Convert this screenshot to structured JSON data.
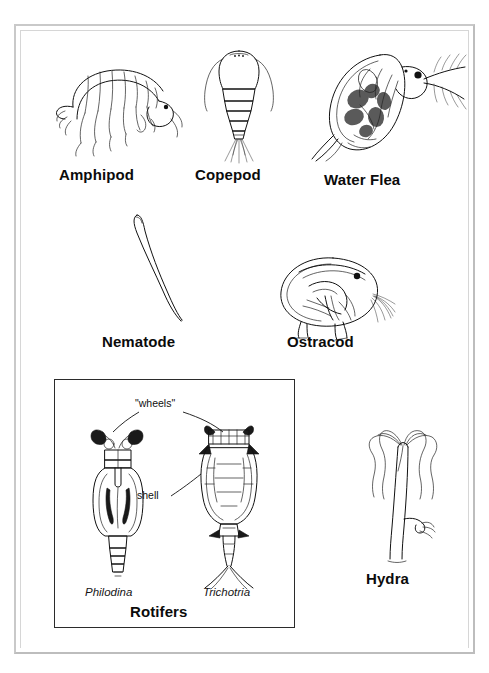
{
  "plate": {
    "title": "Freshwater invertebrate identification plate",
    "background_color": "#ffffff",
    "frame_color": "#c9c9c9",
    "ink_color": "#111111"
  },
  "organisms": [
    {
      "id": "amphipod",
      "label": "Amphipod",
      "icon": "amphipod-drawing"
    },
    {
      "id": "copepod",
      "label": "Copepod",
      "icon": "copepod-drawing"
    },
    {
      "id": "waterflea",
      "label": "Water Flea",
      "icon": "water-flea-drawing"
    },
    {
      "id": "nematode",
      "label": "Nematode",
      "icon": "nematode-drawing"
    },
    {
      "id": "ostracod",
      "label": "Ostracod",
      "icon": "ostracod-drawing"
    },
    {
      "id": "hydra",
      "label": "Hydra",
      "icon": "hydra-drawing"
    }
  ],
  "rotifer_box": {
    "label": "Rotifers",
    "annotations": {
      "wheels": "\"wheels\"",
      "shell": "shell"
    },
    "species": [
      {
        "id": "philodina",
        "name": "Philodina",
        "icon": "philodina-drawing"
      },
      {
        "id": "trichotria",
        "name": "Trichotria",
        "icon": "trichotria-drawing"
      }
    ]
  }
}
